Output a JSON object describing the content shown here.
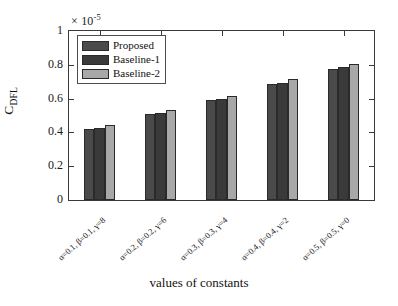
{
  "chart_data": {
    "type": "bar",
    "title": "",
    "xlabel": "values of constants",
    "ylabel": "C_DFL",
    "ylabel_base": "C",
    "ylabel_sub": "DFL",
    "y_exponent_text": "× 10",
    "y_exponent_power": "-5",
    "y_scale": 1e-05,
    "ylim": [
      0,
      1
    ],
    "yticks": [
      0,
      0.2,
      0.4,
      0.6,
      0.8,
      1
    ],
    "ytick_labels": [
      "0",
      "0.2",
      "0.4",
      "0.6",
      "0.8",
      "1"
    ],
    "grid": false,
    "legend_position": "upper left",
    "categories": [
      "α=0.1, β=0.1, γ=8",
      "α=0.2, β=0.2, γ=6",
      "α=0.3, β=0.3, γ=4",
      "α=0.4, β=0.4, γ=2",
      "α=0.5, β=0.5, γ=0"
    ],
    "series": [
      {
        "name": "Proposed",
        "color": "#4a4a4a",
        "values": [
          0.42,
          0.509,
          0.592,
          0.686,
          0.775
        ]
      },
      {
        "name": "Baseline-1",
        "color": "#3a3a3a",
        "values": [
          0.426,
          0.515,
          0.598,
          0.692,
          0.787
        ]
      },
      {
        "name": "Baseline-2",
        "color": "#a8a8a8",
        "values": [
          0.444,
          0.533,
          0.615,
          0.716,
          0.805
        ]
      }
    ]
  },
  "axes": {
    "frame_color": "#3a3a3a",
    "background": "#ffffff"
  }
}
